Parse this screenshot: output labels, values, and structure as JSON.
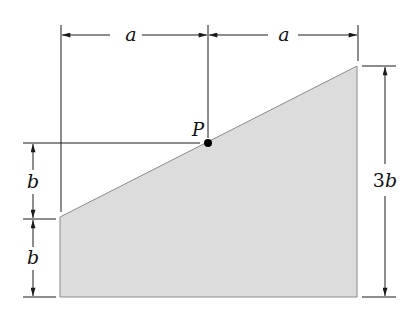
{
  "diagram": {
    "type": "trapezoidal area with dimension lines",
    "colors": {
      "fill": "#dcdcdc",
      "stroke": "#1a1a1a",
      "edge": "#8a8a8a",
      "point": "#000000"
    },
    "labels": {
      "top_left_width": "a",
      "top_right_width": "a",
      "point": "P",
      "left_upper_height": "b",
      "left_lower_height": "b",
      "right_height_coef": "3",
      "right_height_var": "b"
    }
  }
}
